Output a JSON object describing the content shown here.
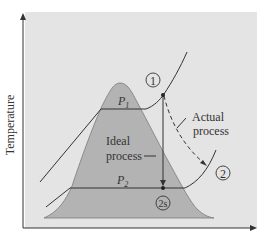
{
  "diagram": {
    "axes": {
      "y_label": "Temperature",
      "x_label": ""
    },
    "regions": {
      "dome_label": "Ideal process",
      "dome_label_line1": "Ideal",
      "dome_label_line2": "process"
    },
    "isobars": [
      {
        "label": "P",
        "subscript": "1"
      },
      {
        "label": "P",
        "subscript": "2"
      }
    ],
    "states": [
      {
        "id": "1",
        "label": "1"
      },
      {
        "id": "2",
        "label": "2"
      },
      {
        "id": "2s",
        "label": "2s"
      }
    ],
    "annotations": {
      "actual_line1": "Actual",
      "actual_line2": "process"
    },
    "colors": {
      "background_panel": "#e4e4e4",
      "dome_fill": "#b3b3b3",
      "line": "#3a3a3a"
    }
  }
}
